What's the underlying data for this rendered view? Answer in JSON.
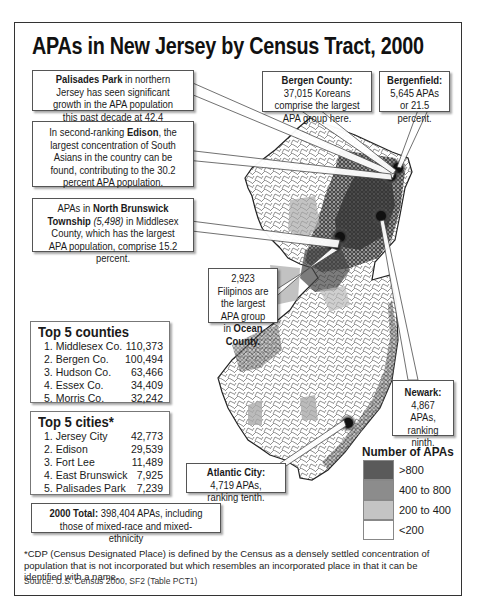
{
  "title": "APAs in New Jersey by Census Tract, 2000",
  "callouts": {
    "palisades_park": {
      "bold": "Palisades Park",
      "text": " in northern Jersey has seen significant growth in the APA population this past decade at 42.4 percent."
    },
    "edison": {
      "pre": "In second-ranking ",
      "bold": "Edison",
      "text": ", the largest concentration of South Asians in the country can be found, contributing to the 30.2 percent APA population."
    },
    "north_brunswick": {
      "pre": "APAs in ",
      "bold": "North Brunswick Township",
      "italic": " (5,498)",
      "text": " in Middlesex County, which has the largest APA population, comprise 15.2 percent."
    },
    "bergen_county": {
      "bold": "Bergen County:",
      "text": " 37,015 Koreans comprise the largest APA group here."
    },
    "bergenfield": {
      "bold": "Bergenfield:",
      "text": " 5,645 APAs or 21.5 percent."
    },
    "ocean_county": {
      "pre": "2,923 Filipinos are the largest APA group in ",
      "bold": "Ocean County."
    },
    "newark": {
      "bold": "Newark:",
      "text": " 4,867 APAs, ranking ninth."
    },
    "atlantic_city": {
      "bold": "Atlantic City:",
      "text": " 4,719 APAs, ranking tenth."
    }
  },
  "top_counties": {
    "heading": "Top 5 counties",
    "rows": [
      {
        "name": "1. Middlesex Co.",
        "value": "110,373"
      },
      {
        "name": "2. Bergen Co.",
        "value": "100,494"
      },
      {
        "name": "3. Hudson Co.",
        "value": "63,466"
      },
      {
        "name": "4. Essex Co.",
        "value": "34,409"
      },
      {
        "name": "5. Morris Co.",
        "value": "32,242"
      }
    ]
  },
  "top_cities": {
    "heading": "Top 5 cities*",
    "rows": [
      {
        "name": "1. Jersey City",
        "value": "42,773"
      },
      {
        "name": "2. Edison",
        "value": "29,539"
      },
      {
        "name": "3. Fort Lee",
        "value": "11,489"
      },
      {
        "name": "4. East Brunswick",
        "value": "7,925"
      },
      {
        "name": "5. Palisades Park",
        "value": "7,239"
      }
    ]
  },
  "total": {
    "bold": "2000 Total:",
    "text": " 398,404 APAs, including those of mixed-race and mixed-ethnicity"
  },
  "legend": {
    "title": "Number of APAs",
    "items": [
      {
        "label": ">800",
        "color": "#5a5a5a"
      },
      {
        "label": "400 to 800",
        "color": "#8c8c8c"
      },
      {
        "label": "200 to 400",
        "color": "#c4c4c4"
      },
      {
        "label": "<200",
        "color": "#ffffff"
      }
    ]
  },
  "footnote": "*CDP (Census Designated Place) is defined by the Census as a densely settled concentration of population that is not incorporated but which resembles an incorporated place in that it can be identified with a name.",
  "source": "Source: U.S. Census 2000, SF2 (Table PCT1)"
}
